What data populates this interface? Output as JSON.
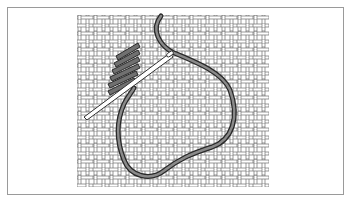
{
  "figure": {
    "caption": "",
    "colors": {
      "frame": "#9a9a9a",
      "mesh_line": "#6e6e6e",
      "mesh_fill": "#ffffff",
      "thread": "#6a6a6a",
      "thread_outline": "#2a2a2a",
      "needle": "#ffffff",
      "needle_outline": "#333333"
    },
    "canvas_mesh": {
      "x": 77,
      "y": 15,
      "width": 192,
      "height": 172,
      "cell": 8
    },
    "stitches": {
      "count": 6,
      "direction": "diagonal"
    },
    "elements": [
      "canvas-mesh",
      "stitches",
      "thread-loop",
      "needle"
    ]
  }
}
